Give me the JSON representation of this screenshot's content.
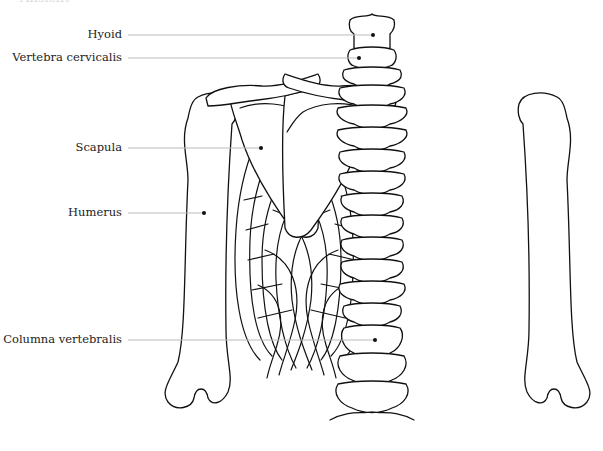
{
  "figure": {
    "title": "Ansicht",
    "labels": [
      {
        "text": "Hyoid",
        "y": 35,
        "right": 122,
        "line_end_x": 373
      },
      {
        "text": "Vertebra cervicalis",
        "y": 58,
        "right": 122,
        "line_end_x": 359
      },
      {
        "text": "Scapula",
        "y": 148,
        "right": 122,
        "line_end_x": 261
      },
      {
        "text": "Humerus",
        "y": 213,
        "right": 122,
        "line_end_x": 204
      },
      {
        "text": "Columna vertebralis",
        "y": 340,
        "right": 122,
        "line_end_x": 375
      }
    ],
    "colors": {
      "stroke": "#111111",
      "leader": "#bbbbbb",
      "background": "#ffffff"
    }
  }
}
